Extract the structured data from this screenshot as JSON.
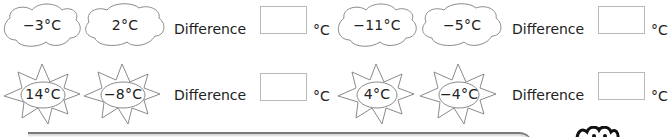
{
  "rows": [
    {
      "kind": "cloud",
      "pairs": [
        {
          "a": "−3°C",
          "b": "2°C",
          "difference_label": "Difference",
          "answer": "",
          "unit": "°C"
        },
        {
          "a": "−11°C",
          "b": "−5°C",
          "difference_label": "Difference",
          "answer": "",
          "unit": "°C"
        }
      ]
    },
    {
      "kind": "sun",
      "pairs": [
        {
          "a": "14°C",
          "b": "−8°C",
          "difference_label": "Difference",
          "answer": "",
          "unit": "°C"
        },
        {
          "a": "4°C",
          "b": "−4°C",
          "difference_label": "Difference",
          "answer": "",
          "unit": "°C"
        }
      ]
    }
  ],
  "icons": {
    "cloud": "cloud-icon",
    "sun": "sun-icon",
    "mascot": "owl-mascot-icon"
  },
  "colors": {
    "outline": "#8a8a8a",
    "box_border": "#b9b9b9",
    "text": "#222222",
    "bar": "#7a7a7a"
  }
}
